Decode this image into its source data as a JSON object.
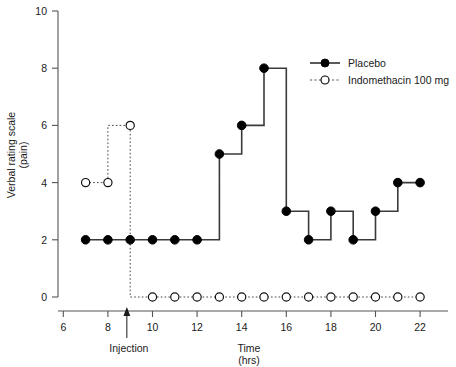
{
  "chart_data": {
    "type": "line",
    "title": "",
    "xlabel": "Time",
    "xlabel_units": "(hrs)",
    "ylabel": "Verbal rating scale",
    "ylabel_units": "(pain)",
    "xlim": [
      6,
      23
    ],
    "ylim": [
      0,
      10
    ],
    "grid": false,
    "legend_position": "top-right",
    "x_ticks": [
      6,
      8,
      10,
      12,
      14,
      16,
      18,
      20,
      22
    ],
    "x_tick_labels": [
      "6",
      "8",
      "10",
      "12",
      "14",
      "16",
      "18",
      "20",
      "22"
    ],
    "x_minor_ticks": [
      7,
      9,
      11,
      13,
      15,
      17,
      19,
      21
    ],
    "y_ticks": [
      0,
      2,
      4,
      6,
      8,
      10
    ],
    "y_tick_labels": [
      "0",
      "2",
      "4",
      "6",
      "8",
      "10"
    ],
    "line_style": "step-post",
    "series": [
      {
        "name": "Placebo",
        "marker": "filled-circle",
        "linestyle": "solid",
        "color": "#000000",
        "x": [
          7,
          8,
          9,
          10,
          11,
          12,
          13,
          14,
          15,
          16,
          17,
          18,
          19,
          20,
          21,
          22
        ],
        "values": [
          2,
          2,
          2,
          2,
          2,
          2,
          5,
          6,
          8,
          3,
          2,
          3,
          2,
          3,
          4,
          4
        ]
      },
      {
        "name": "Indomethacin 100 mg",
        "marker": "open-circle",
        "linestyle": "dotted",
        "color": "#000000",
        "x": [
          7,
          8,
          9,
          10,
          11,
          12,
          13,
          14,
          15,
          16,
          17,
          18,
          19,
          20,
          21,
          22
        ],
        "values": [
          4,
          4,
          6,
          0,
          0,
          0,
          0,
          0,
          0,
          0,
          0,
          0,
          0,
          0,
          0,
          0
        ]
      }
    ],
    "annotations": [
      {
        "name": "injection-marker",
        "label": "Injection",
        "x": 8.85,
        "type": "arrow-up"
      }
    ]
  },
  "legend": {
    "items": [
      {
        "label": "Placebo",
        "marker": "filled-circle",
        "linestyle": "solid"
      },
      {
        "label": "Indomethacin 100 mg",
        "marker": "open-circle",
        "linestyle": "dotted"
      }
    ]
  },
  "axes": {
    "y_title_line1": "Verbal rating scale",
    "y_title_line2": "(pain)",
    "x_title_line1": "Time",
    "x_title_line2": "(hrs)"
  }
}
